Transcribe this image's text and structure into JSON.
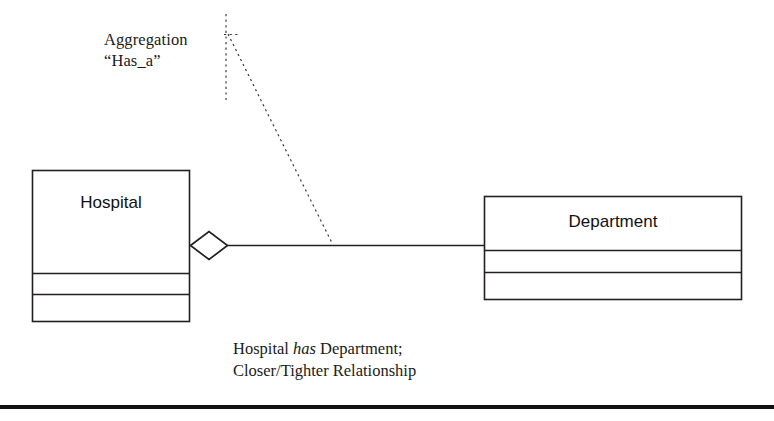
{
  "diagram": {
    "type": "uml-class-diagram",
    "relationship": "aggregation",
    "background_color": "#ffffff",
    "stroke_color": "#231f20",
    "annotation": {
      "line1": "Aggregation",
      "line2": "“Has_a”"
    },
    "classes": [
      {
        "id": "hospital",
        "name": "Hospital",
        "compartments": 3,
        "x": 32,
        "y": 170,
        "width": 158,
        "height": 152,
        "divider_y": [
          273,
          294
        ]
      },
      {
        "id": "department",
        "name": "Department",
        "compartments": 3,
        "x": 484,
        "y": 196,
        "width": 258,
        "height": 104,
        "divider_y": [
          250,
          272
        ]
      }
    ],
    "connector": {
      "kind": "aggregation-link",
      "from": "hospital",
      "to": "department",
      "diamond_filled": false,
      "line_y": 245
    },
    "leader_lines": [
      {
        "kind": "dotted-vertical",
        "x": 226,
        "y1": 14,
        "y2": 100
      },
      {
        "kind": "dotted-diagonal",
        "x1": 228,
        "y1": 34,
        "x2": 332,
        "y2": 243
      }
    ],
    "caption": {
      "line1_pre": "Hospital ",
      "line1_em": "has",
      "line1_post": " Department;",
      "line2": "Closer/Tighter Relationship"
    },
    "footer_rule": true
  }
}
